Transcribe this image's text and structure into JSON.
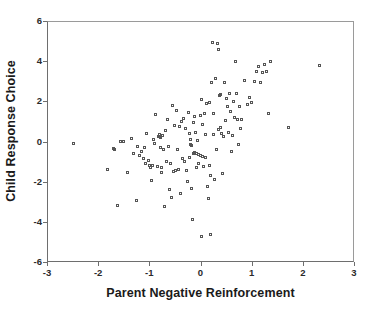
{
  "chart_data": {
    "type": "scatter",
    "title": "",
    "xlabel": "Parent Negative Reinforcement",
    "ylabel": "Child Response Choice",
    "xlim": [
      -3,
      3
    ],
    "ylim": [
      -6,
      6
    ],
    "xticks": [
      -3,
      -2,
      -1,
      0,
      1,
      2,
      3
    ],
    "yticks": [
      -6,
      -4,
      -2,
      0,
      2,
      4,
      6
    ],
    "xtick_labels": [
      "-3",
      "-2",
      "-1",
      "0",
      "1",
      "2",
      "3"
    ],
    "ytick_labels": [
      "-6",
      "-4",
      "-2",
      "0",
      "2",
      "4",
      "6"
    ],
    "grid": false,
    "legend": null,
    "marker": "open-square",
    "marker_color": "#555555",
    "n_points": 160,
    "series": [
      {
        "name": "observations",
        "points": [
          [
            -2.48,
            -0.12
          ],
          [
            -1.8,
            -1.42
          ],
          [
            -1.7,
            -0.38
          ],
          [
            -1.68,
            -0.42
          ],
          [
            -1.62,
            -3.22
          ],
          [
            -1.56,
            -0.02
          ],
          [
            -1.5,
            -0.03
          ],
          [
            -1.42,
            -1.55
          ],
          [
            -1.34,
            0.12
          ],
          [
            -1.3,
            -0.62
          ],
          [
            -1.24,
            -2.98
          ],
          [
            -1.22,
            -0.28
          ],
          [
            -1.18,
            -0.74
          ],
          [
            -1.14,
            -0.52
          ],
          [
            -1.1,
            -0.88
          ],
          [
            -1.08,
            -0.3
          ],
          [
            -1.06,
            -1.14
          ],
          [
            -1.04,
            0.38
          ],
          [
            -1.0,
            -0.98
          ],
          [
            -0.98,
            -1.2
          ],
          [
            -0.96,
            -1.3
          ],
          [
            -0.94,
            -1.95
          ],
          [
            -0.92,
            -1.22
          ],
          [
            -0.9,
            0.06
          ],
          [
            -0.88,
            -0.1
          ],
          [
            -0.86,
            1.32
          ],
          [
            -0.84,
            -1.28
          ],
          [
            -0.82,
            0.22
          ],
          [
            -0.8,
            0.24
          ],
          [
            -0.8,
            0.3
          ],
          [
            -0.78,
            0.18
          ],
          [
            -0.78,
            -0.34
          ],
          [
            -0.76,
            -1.32
          ],
          [
            -0.76,
            -1.58
          ],
          [
            -0.74,
            0.26
          ],
          [
            -0.72,
            -0.44
          ],
          [
            -0.7,
            -3.28
          ],
          [
            -0.68,
            0.52
          ],
          [
            -0.66,
            -1.02
          ],
          [
            -0.64,
            1.05
          ],
          [
            -0.62,
            -0.26
          ],
          [
            -0.6,
            -2.4
          ],
          [
            -0.58,
            -1.1
          ],
          [
            -0.56,
            -2.82
          ],
          [
            -0.54,
            1.78
          ],
          [
            -0.52,
            -1.52
          ],
          [
            -0.5,
            0.78
          ],
          [
            -0.48,
            -1.48
          ],
          [
            -0.46,
            1.52
          ],
          [
            -0.44,
            -0.4
          ],
          [
            -0.42,
            -1.44
          ],
          [
            -0.4,
            0.7
          ],
          [
            -0.38,
            -2.62
          ],
          [
            -0.36,
            0.98
          ],
          [
            -0.34,
            -0.86
          ],
          [
            -0.32,
            1.1
          ],
          [
            -0.3,
            -1.04
          ],
          [
            -0.28,
            0.62
          ],
          [
            -0.26,
            -1.46
          ],
          [
            -0.24,
            -2.02
          ],
          [
            -0.22,
            1.42
          ],
          [
            -0.2,
            -0.8
          ],
          [
            -0.2,
            0.38
          ],
          [
            -0.18,
            0.08
          ],
          [
            -0.18,
            -0.18
          ],
          [
            -0.16,
            -0.22
          ],
          [
            -0.16,
            -2.38
          ],
          [
            -0.14,
            -3.9
          ],
          [
            -0.12,
            0.9
          ],
          [
            -0.12,
            -0.6
          ],
          [
            -0.1,
            -0.56
          ],
          [
            -0.1,
            1.2
          ],
          [
            -0.08,
            0.44
          ],
          [
            -0.06,
            -0.64
          ],
          [
            -0.06,
            -1.34
          ],
          [
            -0.04,
            0.04
          ],
          [
            -0.02,
            -0.68
          ],
          [
            -0.02,
            -1.12
          ],
          [
            0.0,
            -0.72
          ],
          [
            0.0,
            1.26
          ],
          [
            0.02,
            2.06
          ],
          [
            0.02,
            -4.76
          ],
          [
            0.04,
            -0.76
          ],
          [
            0.04,
            0.82
          ],
          [
            0.06,
            -1.26
          ],
          [
            0.08,
            1.38
          ],
          [
            0.1,
            -0.84
          ],
          [
            0.1,
            0.34
          ],
          [
            0.12,
            1.88
          ],
          [
            0.14,
            -2.26
          ],
          [
            0.16,
            -2.84
          ],
          [
            0.18,
            1.92
          ],
          [
            0.18,
            -1.2
          ],
          [
            0.2,
            -4.66
          ],
          [
            0.2,
            -1.7
          ],
          [
            0.22,
            2.9
          ],
          [
            0.24,
            4.88
          ],
          [
            0.26,
            1.36
          ],
          [
            0.26,
            0.3
          ],
          [
            0.28,
            -1.94
          ],
          [
            0.3,
            3.12
          ],
          [
            0.32,
            -0.42
          ],
          [
            0.34,
            4.86
          ],
          [
            0.36,
            0.58
          ],
          [
            0.36,
            4.58
          ],
          [
            0.38,
            2.26
          ],
          [
            0.4,
            0.68
          ],
          [
            0.4,
            2.34
          ],
          [
            0.42,
            0.36
          ],
          [
            0.44,
            -1.62
          ],
          [
            0.46,
            0.2
          ],
          [
            0.48,
            2.92
          ],
          [
            0.5,
            1.02
          ],
          [
            0.52,
            2.14
          ],
          [
            0.54,
            1.72
          ],
          [
            0.56,
            0.4
          ],
          [
            0.58,
            2.38
          ],
          [
            0.6,
            1.46
          ],
          [
            0.62,
            -0.52
          ],
          [
            0.64,
            0.26
          ],
          [
            0.66,
            1.98
          ],
          [
            0.68,
            1.16
          ],
          [
            0.7,
            3.98
          ],
          [
            0.7,
            3.96
          ],
          [
            0.72,
            2.36
          ],
          [
            0.74,
            1.08
          ],
          [
            0.76,
            -0.16
          ],
          [
            0.78,
            1.74
          ],
          [
            0.8,
            0.62
          ],
          [
            0.82,
            1.06
          ],
          [
            0.86,
            3.02
          ],
          [
            0.92,
            1.84
          ],
          [
            0.96,
            2.18
          ],
          [
            1.0,
            1.92
          ],
          [
            1.06,
            2.96
          ],
          [
            1.1,
            3.46
          ],
          [
            1.14,
            3.72
          ],
          [
            1.18,
            2.92
          ],
          [
            1.22,
            3.4
          ],
          [
            1.26,
            3.82
          ],
          [
            1.3,
            3.44
          ],
          [
            1.34,
            1.36
          ],
          [
            1.38,
            3.94
          ],
          [
            1.73,
            0.65
          ],
          [
            2.34,
            3.74
          ]
        ]
      }
    ]
  },
  "axes": {
    "x_title": "Parent Negative Reinforcement",
    "y_title": "Child Response Choice"
  }
}
